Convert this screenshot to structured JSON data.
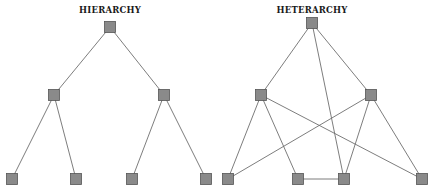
{
  "colors": {
    "background": "#ffffff",
    "node_fill": "#8a8a8a",
    "node_stroke": "#555555",
    "edge": "#6e6e6e",
    "title": "#1a1a1a"
  },
  "node_size": 11,
  "diagrams": [
    {
      "id": "hierarchy",
      "title": "HIERARCHY",
      "title_pos": [
        110,
        10
      ],
      "nodes": [
        {
          "id": "h-root",
          "x": 110,
          "y": 27
        },
        {
          "id": "h-l2-left",
          "x": 54,
          "y": 95
        },
        {
          "id": "h-l2-right",
          "x": 164,
          "y": 95
        },
        {
          "id": "h-leaf-1",
          "x": 12,
          "y": 179
        },
        {
          "id": "h-leaf-2",
          "x": 76,
          "y": 179
        },
        {
          "id": "h-leaf-3",
          "x": 132,
          "y": 179
        },
        {
          "id": "h-leaf-4",
          "x": 206,
          "y": 179
        }
      ],
      "edges": [
        [
          "h-root",
          "h-l2-left"
        ],
        [
          "h-root",
          "h-l2-right"
        ],
        [
          "h-l2-left",
          "h-leaf-1"
        ],
        [
          "h-l2-left",
          "h-leaf-2"
        ],
        [
          "h-l2-right",
          "h-leaf-3"
        ],
        [
          "h-l2-right",
          "h-leaf-4"
        ]
      ]
    },
    {
      "id": "heterarchy",
      "title": "HETERARCHY",
      "title_pos": [
        312,
        10
      ],
      "nodes": [
        {
          "id": "x-top",
          "x": 312,
          "y": 23
        },
        {
          "id": "x-mid-left",
          "x": 261,
          "y": 95
        },
        {
          "id": "x-mid-right",
          "x": 371,
          "y": 95
        },
        {
          "id": "x-bot-1",
          "x": 228,
          "y": 179
        },
        {
          "id": "x-bot-2",
          "x": 298,
          "y": 179
        },
        {
          "id": "x-bot-3",
          "x": 344,
          "y": 179
        },
        {
          "id": "x-bot-4",
          "x": 422,
          "y": 179
        }
      ],
      "edges": [
        [
          "x-top",
          "x-mid-left"
        ],
        [
          "x-top",
          "x-mid-right"
        ],
        [
          "x-top",
          "x-bot-3"
        ],
        [
          "x-mid-left",
          "x-bot-1"
        ],
        [
          "x-mid-left",
          "x-bot-2"
        ],
        [
          "x-mid-left",
          "x-bot-4"
        ],
        [
          "x-mid-right",
          "x-bot-1"
        ],
        [
          "x-mid-right",
          "x-bot-3"
        ],
        [
          "x-mid-right",
          "x-bot-4"
        ],
        [
          "x-bot-2",
          "x-bot-3"
        ]
      ]
    }
  ]
}
